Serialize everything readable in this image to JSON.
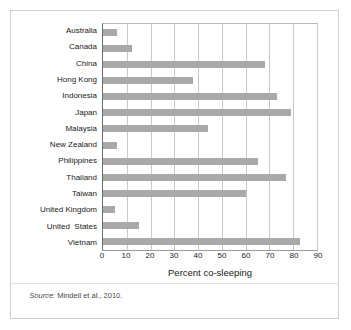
{
  "figure": {
    "source_prefix": "Source:",
    "source_text": " Mindell et al., 2010."
  },
  "chart_data": {
    "type": "bar",
    "orientation": "horizontal",
    "title": "",
    "xlabel": "Percent co-sleeping",
    "ylabel": "",
    "xlim": [
      0,
      90
    ],
    "ylim": null,
    "grid": true,
    "legend": null,
    "bar_color": "#a9a9a9",
    "xticks": [
      0,
      10,
      20,
      30,
      40,
      50,
      60,
      70,
      80,
      90
    ],
    "xtick_labels": [
      "0",
      "10",
      "20",
      "30",
      "40",
      "50",
      "60",
      "70",
      "80",
      "90"
    ],
    "categories": [
      "Australia",
      "Canada",
      "China",
      "Hong Kong",
      "Indonesia",
      "Japan",
      "Malaysia",
      "New Zealand",
      "Philippines",
      "Thailand",
      "Taiwan",
      "United Kingdom",
      "United  States",
      "Vietnam"
    ],
    "values": [
      6,
      12,
      68,
      38,
      73,
      79,
      44,
      6,
      65,
      77,
      60,
      5,
      15,
      83
    ]
  }
}
